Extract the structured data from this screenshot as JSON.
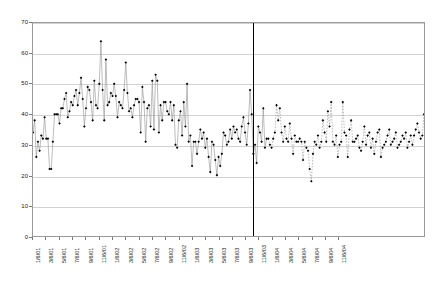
{
  "chart_data": {
    "type": "line",
    "title": "",
    "subtitle": "",
    "xlabel": "",
    "ylabel": "",
    "ylim": [
      0,
      70
    ],
    "ytick_values": [
      0,
      10,
      20,
      30,
      40,
      50,
      60,
      70
    ],
    "ytick_labels": [
      "0",
      "10",
      "20",
      "30",
      "40",
      "50",
      "60",
      "70"
    ],
    "grid": true,
    "legend": "none",
    "xtick_labels": [
      "1/6/01",
      "3/6/01",
      "5/6/01",
      "7/6/01",
      "9/6/01",
      "11/6/01",
      "1/6/02",
      "3/6/02",
      "5/6/02",
      "7/6/02",
      "9/6/02",
      "11/6/02",
      "1/6/03",
      "3/6/03",
      "5/6/03",
      "7/6/03",
      "9/6/03",
      "11/6/03",
      "1/6/04",
      "3/6/04",
      "5/6/04",
      "7/6/04",
      "9/6/04",
      "11/6/04"
    ],
    "xtick_interval_points": 8,
    "annotations": [
      {
        "name": "regime-divider",
        "type": "vline",
        "x_index": 132,
        "color": "#000000",
        "label": ""
      }
    ],
    "series": [
      {
        "name": "historical",
        "style": "solid",
        "line_color": "#999999",
        "marker": "diamond",
        "marker_color": "#000000",
        "values": [
          34,
          38,
          26,
          31,
          28,
          33,
          32,
          39,
          32,
          32,
          22,
          22,
          31,
          40,
          40,
          40,
          37,
          42,
          42,
          45,
          47,
          39,
          41,
          44,
          43,
          46,
          48,
          43,
          47,
          52,
          45,
          36,
          42,
          49,
          48,
          44,
          38,
          51,
          43,
          42,
          50,
          64,
          48,
          38,
          58,
          43,
          44,
          47,
          46,
          50,
          46,
          39,
          44,
          43,
          42,
          48,
          57,
          47,
          41,
          42,
          39,
          43,
          45,
          45,
          44,
          34,
          49,
          44,
          31,
          42,
          43,
          36,
          51,
          35,
          53,
          51,
          34,
          43,
          38,
          44,
          44,
          41,
          40,
          44,
          38,
          43,
          30,
          29,
          38,
          41,
          33,
          44,
          36,
          50,
          31,
          33,
          23,
          31,
          31,
          27,
          31,
          35,
          32,
          34,
          29,
          32,
          26,
          21,
          31,
          30,
          25,
          20,
          26,
          23,
          27,
          34,
          33,
          30,
          31,
          35,
          32,
          36,
          34,
          35,
          32,
          31,
          36,
          39,
          34,
          30,
          37,
          48,
          40,
          27,
          30,
          24,
          36,
          34,
          31,
          42,
          29,
          32
        ]
      },
      {
        "name": "forecast",
        "style": "dashed",
        "line_color": "#999999",
        "marker": "diamond",
        "marker_color": "#000000",
        "values": [
          32,
          30,
          29,
          32,
          34,
          43,
          38,
          42,
          34,
          31,
          36,
          32,
          31,
          37,
          32,
          27,
          33,
          31,
          31,
          32,
          31,
          25,
          31,
          29,
          28,
          22,
          18,
          27,
          31,
          30,
          33,
          29,
          31,
          38,
          34,
          31,
          41,
          36,
          44,
          31,
          30,
          33,
          26,
          30,
          31,
          44,
          34,
          33,
          26,
          35,
          38,
          31,
          31,
          32,
          33,
          29,
          28,
          31,
          36,
          30,
          33,
          34,
          29,
          32,
          27,
          31,
          34,
          35,
          26,
          29,
          30,
          31,
          33,
          35,
          30,
          31,
          32,
          34,
          29,
          30,
          31,
          33,
          32,
          34,
          29,
          31,
          33,
          30,
          33,
          35,
          37,
          34,
          32,
          33,
          40
        ]
      }
    ]
  }
}
